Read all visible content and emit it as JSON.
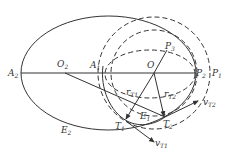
{
  "diagram": {
    "type": "orbital-transfer",
    "colors": {
      "stroke": "#333333",
      "background": "#ffffff"
    },
    "points": {
      "A2": {
        "main": "A",
        "sub": "2"
      },
      "O2": {
        "main": "O",
        "sub": "2"
      },
      "A1": {
        "main": "A",
        "sub": "1"
      },
      "O": {
        "main": "O",
        "sub": ""
      },
      "P3": {
        "main": "P",
        "sub": "3"
      },
      "P2": {
        "main": "P",
        "sub": "2"
      },
      "P1": {
        "main": "P",
        "sub": "1"
      },
      "T1": {
        "main": "T",
        "sub": "1"
      },
      "T2": {
        "main": "T",
        "sub": "2"
      },
      "E1": {
        "main": "E",
        "sub": "1"
      },
      "E2": {
        "main": "E",
        "sub": "2"
      }
    },
    "vectors": {
      "rT1": {
        "main": "r",
        "sub": "T1"
      },
      "rT2": {
        "main": "r",
        "sub": "T2"
      },
      "vT1": {
        "main": "v",
        "sub": "T1"
      },
      "vT2": {
        "main": "v",
        "sub": "T2"
      }
    }
  }
}
